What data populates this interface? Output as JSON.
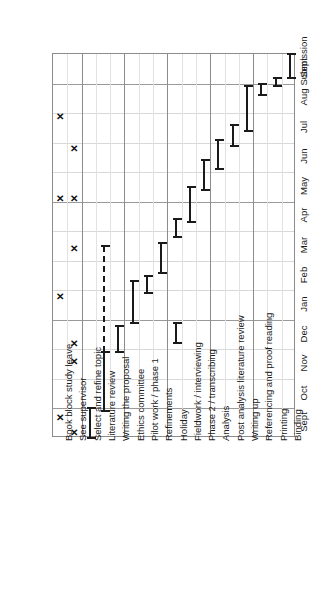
{
  "chart_data": {
    "type": "bar",
    "chart_kind": "gantt",
    "title": "",
    "subtitle": "",
    "xlabel": "",
    "ylabel": "",
    "orientation": "rotated-90",
    "grid": true,
    "legend": "none",
    "time_axis": {
      "name": "Month",
      "ticks": [
        "Sept",
        "Oct",
        "Nov",
        "Dec",
        "Jan",
        "Feb",
        "Mar",
        "Apr",
        "May",
        "Jun",
        "Jul",
        "Aug",
        "Sept",
        "Submission"
      ],
      "range": [
        0,
        13
      ],
      "direction": "bottom-to-top"
    },
    "categories": [
      "Book block study leave",
      "See supervisor",
      "Select and refine topic",
      "Literature review",
      "Writing the proposal",
      "Ethics committee",
      "Pilot work / phase 1",
      "Refinements",
      "Holiday",
      "Fieldwork / interviewing",
      "Phase 2 / transcribing",
      "Analysis",
      "Post analysis literature review",
      "Writing up",
      "Referencing and proof reading",
      "Printing",
      "Binding"
    ],
    "tasks": [
      {
        "name": "Book block study leave",
        "marker": "x",
        "events": [
          0.7,
          4.8,
          8.1,
          10.9
        ],
        "bars": []
      },
      {
        "name": "See supervisor",
        "marker": "x",
        "events": [
          0.2,
          2.6,
          3.2,
          6.4,
          8.1,
          9.8
        ],
        "bars": []
      },
      {
        "name": "Select and refine topic",
        "marker": "bar",
        "events": [],
        "bars": [
          {
            "start": 0.0,
            "end": 1.0,
            "style": "solid"
          }
        ]
      },
      {
        "name": "Literature review",
        "marker": "bar",
        "events": [],
        "bars": [
          {
            "start": 0.9,
            "end": 2.9,
            "style": "solid"
          },
          {
            "start": 2.9,
            "end": 6.5,
            "style": "dashed"
          }
        ]
      },
      {
        "name": "Writing the proposal",
        "marker": "bar",
        "events": [],
        "bars": [
          {
            "start": 2.9,
            "end": 3.8,
            "style": "solid"
          }
        ]
      },
      {
        "name": "Ethics committee",
        "marker": "bar",
        "events": [],
        "bars": [
          {
            "start": 3.9,
            "end": 5.3,
            "style": "solid"
          }
        ]
      },
      {
        "name": "Pilot work / phase 1",
        "marker": "bar",
        "events": [],
        "bars": [
          {
            "start": 4.9,
            "end": 5.5,
            "style": "solid"
          }
        ]
      },
      {
        "name": "Refinements",
        "marker": "bar",
        "events": [],
        "bars": [
          {
            "start": 5.6,
            "end": 6.6,
            "style": "solid"
          }
        ]
      },
      {
        "name": "Holiday",
        "marker": "bar",
        "events": [],
        "bars": [
          {
            "start": 3.2,
            "end": 3.9,
            "style": "solid"
          },
          {
            "start": 6.8,
            "end": 7.4,
            "style": "solid"
          }
        ]
      },
      {
        "name": "Fieldwork / interviewing",
        "marker": "bar",
        "events": [],
        "bars": [
          {
            "start": 7.3,
            "end": 8.5,
            "style": "solid"
          }
        ]
      },
      {
        "name": "Phase 2 / transcribing",
        "marker": "bar",
        "events": [],
        "bars": [
          {
            "start": 8.4,
            "end": 9.4,
            "style": "solid"
          }
        ]
      },
      {
        "name": "Analysis",
        "marker": "bar",
        "events": [],
        "bars": [
          {
            "start": 9.1,
            "end": 10.1,
            "style": "solid"
          }
        ]
      },
      {
        "name": "Post analysis literature review",
        "marker": "bar",
        "events": [],
        "bars": [
          {
            "start": 9.9,
            "end": 10.6,
            "style": "solid"
          }
        ]
      },
      {
        "name": "Writing up",
        "marker": "bar",
        "events": [],
        "bars": [
          {
            "start": 10.4,
            "end": 11.9,
            "style": "solid"
          }
        ]
      },
      {
        "name": "Referencing and proof reading",
        "marker": "bar",
        "events": [],
        "bars": [
          {
            "start": 11.6,
            "end": 12.0,
            "style": "solid"
          }
        ]
      },
      {
        "name": "Printing",
        "marker": "bar",
        "events": [],
        "bars": [
          {
            "start": 11.9,
            "end": 12.2,
            "style": "solid"
          }
        ]
      },
      {
        "name": "Binding",
        "marker": "bar",
        "events": [],
        "bars": [
          {
            "start": 12.2,
            "end": 13.0,
            "style": "solid"
          }
        ]
      }
    ],
    "major_task_dividers": [
      2,
      5,
      8,
      11,
      14
    ],
    "major_month_gridlines": [
      "Oct",
      "Jan",
      "May",
      "Sept"
    ],
    "colors": {
      "bar": "#1a1a1a",
      "marker": "#111111",
      "grid_minor": "#d8d8d8",
      "grid_major": "#9a9a9a",
      "frame": "#8c8c8c",
      "background": "#ffffff",
      "text": "#1a1a1a"
    }
  }
}
